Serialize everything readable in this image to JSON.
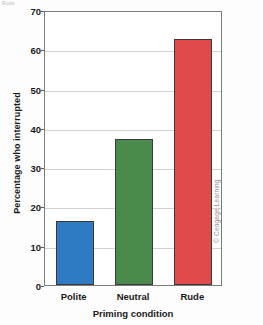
{
  "figure": {
    "caption_remnant": "Rude",
    "credit": "© Cengage Learning"
  },
  "chart_data": {
    "type": "bar",
    "title": "",
    "subtitle": "",
    "categories": [
      "Polite",
      "Neutral",
      "Rude"
    ],
    "values": [
      16.4,
      37.2,
      62.5
    ],
    "series": [
      {
        "name": "Percentage who interrupted",
        "values": [
          16.4,
          37.2,
          62.5
        ]
      }
    ],
    "xlabel": "Priming condition",
    "ylabel": "Percentage who interrupted",
    "ylim": [
      0,
      70
    ],
    "ytick_labels": [
      "0",
      "10",
      "20",
      "30",
      "40",
      "50",
      "60",
      "70"
    ],
    "ytick_values": [
      0,
      10,
      20,
      30,
      40,
      50,
      60,
      70
    ],
    "grid": true,
    "grid_axis": "y",
    "legend": false,
    "legend_position": "none",
    "bar_colors": [
      "#2E7BC4",
      "#4A8A4A",
      "#E04A4A"
    ],
    "bar_edge_color": "#3a3a3a",
    "frame_color": "#7c7c7c",
    "gridline_color": "#d2d2d2",
    "annotations": []
  }
}
